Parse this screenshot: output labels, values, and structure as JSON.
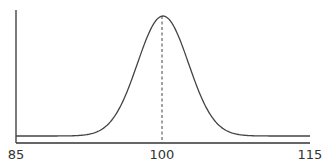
{
  "chart_data": {
    "type": "line",
    "title": "",
    "xlabel": "",
    "ylabel": "",
    "xlim": [
      85,
      115
    ],
    "x_ticks": [
      "85",
      "100",
      "115"
    ],
    "grid": false,
    "legend": null,
    "series": [
      {
        "name": "normal curve",
        "mean": 100,
        "description": "bell curve centered at 100, flat near baseline from 85 to ~91 and from ~109 to 115",
        "x": [
          85,
          91,
          93,
          95,
          97,
          98,
          99,
          100,
          101,
          102,
          103,
          105,
          107,
          109,
          115
        ],
        "y": [
          0.03,
          0.03,
          0.12,
          0.32,
          0.62,
          0.78,
          0.93,
          1.0,
          0.93,
          0.78,
          0.62,
          0.32,
          0.12,
          0.03,
          0.03
        ]
      }
    ],
    "annotations": [
      {
        "type": "dashed-vertical-line",
        "x": 100,
        "label": "mean"
      }
    ]
  },
  "axes": {
    "x_ticks": [
      {
        "label": "85",
        "value": 85
      },
      {
        "label": "100",
        "value": 100
      },
      {
        "label": "115",
        "value": 115
      }
    ]
  }
}
